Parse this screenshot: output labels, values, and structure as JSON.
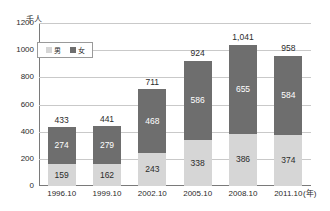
{
  "chart_data": {
    "type": "bar",
    "subtype": "stacked",
    "title": "",
    "xlabel": "(年)",
    "ylabel": "千人",
    "unit_label": "千人",
    "categories": [
      "1996.10",
      "1999.10",
      "2002.10",
      "2005.10",
      "2008.10",
      "2011.10"
    ],
    "series": [
      {
        "name": "男",
        "color": "#d6d6d6",
        "values": [
          159,
          162,
          243,
          338,
          386,
          374
        ]
      },
      {
        "name": "女",
        "color": "#6e6e6e",
        "values": [
          274,
          279,
          468,
          586,
          655,
          584
        ]
      }
    ],
    "totals": [
      433,
      441,
      711,
      924,
      1041,
      958
    ],
    "total_labels": [
      "433",
      "441",
      "711",
      "924",
      "1,041",
      "958"
    ],
    "ylim": [
      0,
      1200
    ],
    "yticks": [
      0,
      200,
      400,
      600,
      800,
      1000,
      1200
    ],
    "ytick_labels": [
      "0",
      "200",
      "400",
      "600",
      "800",
      "1000",
      "1200"
    ],
    "grid": true,
    "legend_position": "upper-left",
    "bars": [
      {
        "category": "1996.10",
        "total_label": "433",
        "female_label": "274",
        "male_label": "159"
      },
      {
        "category": "1999.10",
        "total_label": "441",
        "female_label": "279",
        "male_label": "162"
      },
      {
        "category": "2002.10",
        "total_label": "711",
        "female_label": "468",
        "male_label": "243"
      },
      {
        "category": "2005.10",
        "total_label": "924",
        "female_label": "586",
        "male_label": "338"
      },
      {
        "category": "2008.10",
        "total_label": "1,041",
        "female_label": "655",
        "male_label": "386"
      },
      {
        "category": "2011.10",
        "total_label": "958",
        "female_label": "584",
        "male_label": "374"
      }
    ]
  },
  "legend": {
    "items": [
      {
        "label": "男",
        "color": "#d6d6d6"
      },
      {
        "label": "女",
        "color": "#6e6e6e"
      }
    ]
  },
  "axis": {
    "y_unit": "千人",
    "x_unit": "(年)"
  },
  "colors": {
    "male": "#d6d6d6",
    "female": "#6e6e6e",
    "grid": "#c9c9c9",
    "axis": "#7a7a7a",
    "text": "#2b2b2b",
    "background": "#ffffff"
  }
}
